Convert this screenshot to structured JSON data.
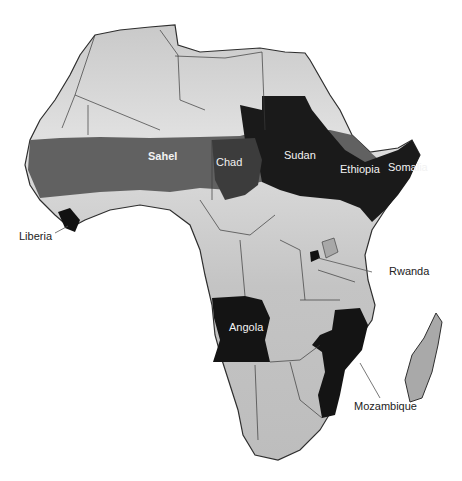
{
  "map": {
    "region": "Africa",
    "colors": {
      "background": "#ffffff",
      "land_light": "#cfcfcf",
      "land_mid": "#9a9a9a",
      "sahel_band": "#5e5e5e",
      "conflict_dark": "#111111",
      "border": "#3a3a3a"
    },
    "labels": [
      {
        "id": "sahel",
        "text": "Sahel",
        "x": 163,
        "y": 150,
        "style": "light bold"
      },
      {
        "id": "chad",
        "text": "Chad",
        "x": 216,
        "y": 161,
        "style": "light"
      },
      {
        "id": "sudan",
        "text": "Sudan",
        "x": 284,
        "y": 154,
        "style": "light"
      },
      {
        "id": "ethiopia",
        "text": "Ethiopia",
        "x": 340,
        "y": 168,
        "style": "light"
      },
      {
        "id": "somalia",
        "text": "Somalia",
        "x": 388,
        "y": 166,
        "style": "light"
      },
      {
        "id": "liberia",
        "text": "Liberia",
        "x": 19,
        "y": 230,
        "style": "dark"
      },
      {
        "id": "rwanda",
        "text": "Rwanda",
        "x": 389,
        "y": 270,
        "style": "dark"
      },
      {
        "id": "angola",
        "text": "Angola",
        "x": 229,
        "y": 324,
        "style": "light"
      },
      {
        "id": "mozambique",
        "text": "Mozambique",
        "x": 354,
        "y": 404,
        "style": "dark"
      }
    ]
  }
}
